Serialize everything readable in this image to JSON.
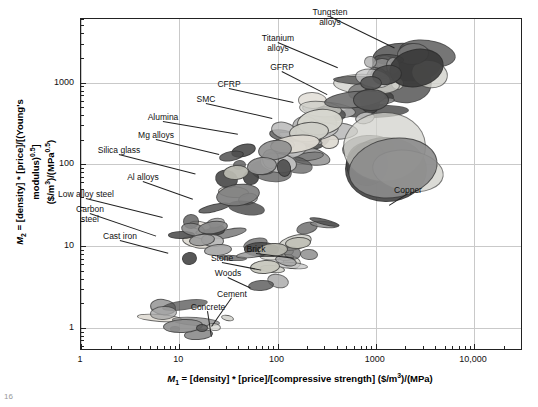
{
  "figure": {
    "caption_fragment": "16"
  },
  "chart_data": {
    "type": "scatter",
    "title": "",
    "xlabel": "M1 = [density] * [price]/[compressive strength] ($/m3)/(MPa)",
    "ylabel": "M2 = [density] * [price]/[(Young's modulus)0.5] ($/m3)/(MPa0.5)",
    "xscale": "log",
    "yscale": "log",
    "xlim": [
      1,
      30000
    ],
    "ylim": [
      0.55,
      6000
    ],
    "xticks": [
      1,
      10,
      100,
      1000,
      10000
    ],
    "xticklabels": [
      "1",
      "10",
      "100",
      "1000",
      "10,000"
    ],
    "yticks": [
      1,
      10,
      100,
      1000
    ],
    "yticklabels": [
      "1",
      "10",
      "100",
      "1000"
    ],
    "grid": true,
    "legend": "none",
    "annotations": [
      {
        "label": "Tungsten\nalloys",
        "x": 1600,
        "y": 2600
      },
      {
        "label": "Titanium\nalloys",
        "x": 420,
        "y": 1500
      },
      {
        "label": "GFRP",
        "x": 330,
        "y": 700
      },
      {
        "label": "CFRP",
        "x": 150,
        "y": 560
      },
      {
        "label": "SMC",
        "x": 90,
        "y": 360
      },
      {
        "label": "Alumina",
        "x": 40,
        "y": 230
      },
      {
        "label": "Mg alloys",
        "x": 26,
        "y": 130
      },
      {
        "label": "Silica glass",
        "x": 15,
        "y": 75
      },
      {
        "label": "Al alloys",
        "x": 14,
        "y": 37
      },
      {
        "label": "Low alloy steel",
        "x": 7,
        "y": 22
      },
      {
        "label": "Carbon\nsteel",
        "x": 6,
        "y": 13
      },
      {
        "label": "Cast iron",
        "x": 8,
        "y": 8
      },
      {
        "label": "Copper",
        "x": 1400,
        "y": 30
      },
      {
        "label": "Brick",
        "x": 150,
        "y": 7
      },
      {
        "label": "Stone",
        "x": 70,
        "y": 5
      },
      {
        "label": "Woods",
        "x": 55,
        "y": 3
      },
      {
        "label": "Cement",
        "x": 22,
        "y": 1.0
      },
      {
        "label": "Concrete",
        "x": 22,
        "y": 0.75
      }
    ],
    "bubbles": [
      {
        "name": "tungsten-alloys-1",
        "x": 2600,
        "y": 1500,
        "w": 55,
        "h": 38,
        "rot": -12,
        "color": "#3a3a3a",
        "alpha": 0.9
      },
      {
        "name": "tungsten-alloys-2",
        "x": 1300,
        "y": 1250,
        "w": 30,
        "h": 20,
        "rot": -10,
        "color": "#4a4a4a",
        "alpha": 0.9
      },
      {
        "name": "tungsten-alloys-3",
        "x": 900,
        "y": 1000,
        "w": 22,
        "h": 14,
        "rot": 0,
        "color": "#565656",
        "alpha": 0.9
      },
      {
        "name": "titanium-alloys",
        "x": 620,
        "y": 620,
        "w": 62,
        "h": 17,
        "rot": -6,
        "color": "#6f6f6f",
        "alpha": 0.9
      },
      {
        "name": "titanium-alloys-2",
        "x": 900,
        "y": 620,
        "w": 36,
        "h": 22,
        "rot": 0,
        "color": "#5b5b5b",
        "alpha": 0.9
      },
      {
        "name": "gfrp",
        "x": 270,
        "y": 330,
        "w": 46,
        "h": 26,
        "rot": -6,
        "color": "#d8d8d0",
        "alpha": 0.95
      },
      {
        "name": "cfrp",
        "x": 210,
        "y": 250,
        "w": 40,
        "h": 20,
        "rot": -5,
        "color": "#cfcfc8",
        "alpha": 0.95
      },
      {
        "name": "smc",
        "x": 150,
        "y": 175,
        "w": 50,
        "h": 18,
        "rot": -7,
        "color": "#dedad2",
        "alpha": 0.95
      },
      {
        "name": "alumina",
        "x": 95,
        "y": 150,
        "w": 34,
        "h": 20,
        "rot": -8,
        "color": "#8e8e8e",
        "alpha": 0.9
      },
      {
        "name": "mg-alloys",
        "x": 70,
        "y": 95,
        "w": 30,
        "h": 18,
        "rot": -6,
        "color": "#9a9a9a",
        "alpha": 0.9
      },
      {
        "name": "silica-glass",
        "x": 38,
        "y": 80,
        "w": 26,
        "h": 15,
        "rot": -5,
        "color": "#b9b9b0",
        "alpha": 0.95
      },
      {
        "name": "al-alloys",
        "x": 40,
        "y": 42,
        "w": 44,
        "h": 22,
        "rot": -8,
        "color": "#7d7d7d",
        "alpha": 0.9
      },
      {
        "name": "low-alloy-steel",
        "x": 22,
        "y": 17,
        "w": 30,
        "h": 13,
        "rot": -8,
        "color": "#8a8a8a",
        "alpha": 0.9
      },
      {
        "name": "carbon-steel",
        "x": 17,
        "y": 12,
        "w": 26,
        "h": 12,
        "rot": -6,
        "color": "#9b9b9b",
        "alpha": 0.9
      },
      {
        "name": "cast-iron",
        "x": 25,
        "y": 9,
        "w": 28,
        "h": 12,
        "rot": -5,
        "color": "#a6a6a6",
        "alpha": 0.9
      },
      {
        "name": "copper",
        "x": 1500,
        "y": 90,
        "w": 90,
        "h": 60,
        "rot": -10,
        "color": "#8c8c8c",
        "alpha": 0.9
      },
      {
        "name": "stone",
        "x": 90,
        "y": 9,
        "w": 30,
        "h": 14,
        "rot": -4,
        "color": "#b5b5ac",
        "alpha": 0.95
      },
      {
        "name": "brick",
        "x": 160,
        "y": 11,
        "w": 26,
        "h": 12,
        "rot": -4,
        "color": "#c2c2b8",
        "alpha": 0.95
      },
      {
        "name": "woods",
        "x": 75,
        "y": 5.5,
        "w": 30,
        "h": 14,
        "rot": -4,
        "color": "#c8c8be",
        "alpha": 0.95
      },
      {
        "name": "cement",
        "x": 11,
        "y": 1.05,
        "w": 40,
        "h": 14,
        "rot": -3,
        "color": "#8f8f8f",
        "alpha": 0.9
      },
      {
        "name": "concrete",
        "x": 17,
        "y": 1.0,
        "w": 12,
        "h": 8,
        "rot": 0,
        "color": "#5e5e5e",
        "alpha": 0.9
      }
    ]
  }
}
